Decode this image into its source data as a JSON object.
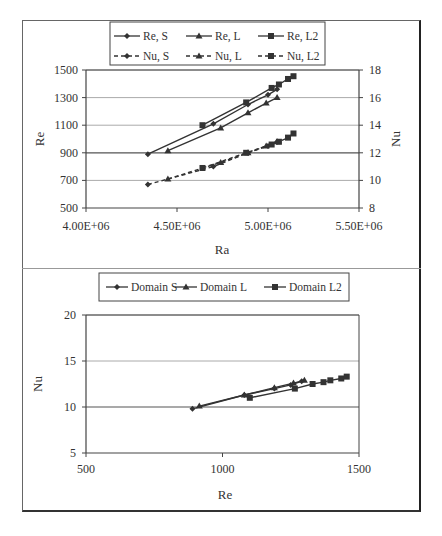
{
  "chart_data": [
    {
      "type": "line",
      "title": "",
      "xlabel": "Ra",
      "ylabel": "Re",
      "y2label": "Nu",
      "xlim": [
        4000000,
        5500000
      ],
      "ylim": [
        500,
        1500
      ],
      "y2lim": [
        8,
        18
      ],
      "x_ticks": [
        "4.00E+06",
        "4.50E+06",
        "5.00E+06",
        "5.50E+06"
      ],
      "y_ticks": [
        "500",
        "700",
        "900",
        "1100",
        "1300",
        "1500"
      ],
      "y2_ticks": [
        "8",
        "10",
        "12",
        "14",
        "16",
        "18"
      ],
      "grid": "horizontal",
      "legend_position": "top",
      "legend": [
        "Re, S",
        "Re, L",
        "Re, L2",
        "Nu, S",
        "Nu, L",
        "Nu, L2"
      ],
      "series": [
        {
          "name": "Re, S",
          "axis": "left",
          "style": "solid",
          "marker": "diamond",
          "x": [
            4340000,
            4700000,
            4890000,
            5000000,
            5050000
          ],
          "y": [
            890,
            1110,
            1250,
            1320,
            1360
          ]
        },
        {
          "name": "Re, L",
          "axis": "left",
          "style": "solid",
          "marker": "triangle",
          "x": [
            4450000,
            4740000,
            4890000,
            4990000,
            5050000
          ],
          "y": [
            915,
            1080,
            1190,
            1260,
            1300
          ]
        },
        {
          "name": "Re, L2",
          "axis": "left",
          "style": "solid",
          "marker": "square",
          "x": [
            4640000,
            4880000,
            5020000,
            5060000,
            5110000,
            5140000
          ],
          "y": [
            1100,
            1265,
            1370,
            1395,
            1435,
            1455
          ]
        },
        {
          "name": "Nu, S",
          "axis": "right",
          "style": "dashed",
          "marker": "diamond",
          "x": [
            4340000,
            4700000,
            4890000,
            5000000,
            5050000
          ],
          "y": [
            9.7,
            11.0,
            12.0,
            12.5,
            12.8
          ]
        },
        {
          "name": "Nu, L",
          "axis": "right",
          "style": "dashed",
          "marker": "triangle",
          "x": [
            4450000,
            4740000,
            4890000,
            4990000,
            5050000
          ],
          "y": [
            10.1,
            11.3,
            12.0,
            12.5,
            12.8
          ]
        },
        {
          "name": "Nu, L2",
          "axis": "right",
          "style": "dashed",
          "marker": "square",
          "x": [
            4640000,
            4880000,
            5020000,
            5060000,
            5110000,
            5140000
          ],
          "y": [
            10.9,
            12.0,
            12.6,
            12.8,
            13.1,
            13.4
          ]
        }
      ]
    },
    {
      "type": "line",
      "title": "",
      "xlabel": "Re",
      "ylabel": "Nu",
      "xlim": [
        500,
        1500
      ],
      "ylim": [
        5,
        20
      ],
      "x_ticks": [
        "500",
        "1000",
        "1500"
      ],
      "y_ticks": [
        "5",
        "10",
        "15",
        "20"
      ],
      "grid": "horizontal",
      "legend_position": "top",
      "legend": [
        "Domain S",
        "Domain L",
        "Domain L2"
      ],
      "series": [
        {
          "name": "Domain S",
          "marker": "diamond",
          "x": [
            890,
            1080,
            1190,
            1250,
            1290
          ],
          "y": [
            9.8,
            11.3,
            12.0,
            12.4,
            12.8
          ]
        },
        {
          "name": "Domain L",
          "marker": "triangle",
          "x": [
            915,
            1080,
            1190,
            1260,
            1300
          ],
          "y": [
            10.1,
            11.3,
            12.1,
            12.6,
            12.9
          ]
        },
        {
          "name": "Domain L2",
          "marker": "square",
          "x": [
            1100,
            1265,
            1330,
            1370,
            1395,
            1435,
            1455
          ],
          "y": [
            11.0,
            12.0,
            12.5,
            12.7,
            12.9,
            13.1,
            13.3
          ]
        }
      ]
    }
  ]
}
